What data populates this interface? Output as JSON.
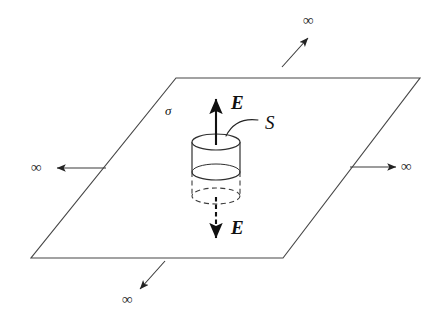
{
  "figure": {
    "background_color": "#ffffff",
    "line_color": "#3a3a3a",
    "ink_color": "#111111"
  },
  "labels": {
    "surface_charge_density": "σ",
    "gaussian_surface": "S",
    "field_up": "E",
    "field_down": "E",
    "infinity_left": "∞",
    "infinity_right": "∞",
    "infinity_top": "∞",
    "infinity_bottom": "∞"
  },
  "plane": {
    "name": "infinite-charged-plane",
    "corners": [
      {
        "x": 176,
        "y": 78
      },
      {
        "x": 420,
        "y": 78
      },
      {
        "x": 283,
        "y": 258
      },
      {
        "x": 31,
        "y": 258
      }
    ]
  },
  "cylinder": {
    "name": "gaussian-cylinder",
    "center_x": 216,
    "top_ellipse_y": 142,
    "mid_ellipse_y": 172,
    "bottom_ellipse_y": 196,
    "radius_x": 24,
    "radius_y": 8,
    "upper_half_style": "solid",
    "lower_half_style": "dashed"
  },
  "field_arrows": [
    {
      "name": "field-arrow-up",
      "style": "solid",
      "from": {
        "x": 216,
        "y": 143
      },
      "to": {
        "x": 216,
        "y": 97
      }
    },
    {
      "name": "field-arrow-down",
      "style": "dashed",
      "from": {
        "x": 216,
        "y": 198
      },
      "to": {
        "x": 216,
        "y": 240
      }
    }
  ],
  "extent_arrows": [
    {
      "name": "extent-arrow-left",
      "direction": "left",
      "from": {
        "x": 104,
        "y": 168
      },
      "to": {
        "x": 55,
        "y": 168
      }
    },
    {
      "name": "extent-arrow-right",
      "direction": "right",
      "from": {
        "x": 351,
        "y": 167
      },
      "to": {
        "x": 397,
        "y": 167
      }
    },
    {
      "name": "extent-arrow-top-right",
      "direction": "up-right",
      "from": {
        "x": 283,
        "y": 66
      },
      "to": {
        "x": 309,
        "y": 37
      }
    },
    {
      "name": "extent-arrow-bottom-left",
      "direction": "down-left",
      "from": {
        "x": 164,
        "y": 262
      },
      "to": {
        "x": 139,
        "y": 290
      }
    }
  ]
}
